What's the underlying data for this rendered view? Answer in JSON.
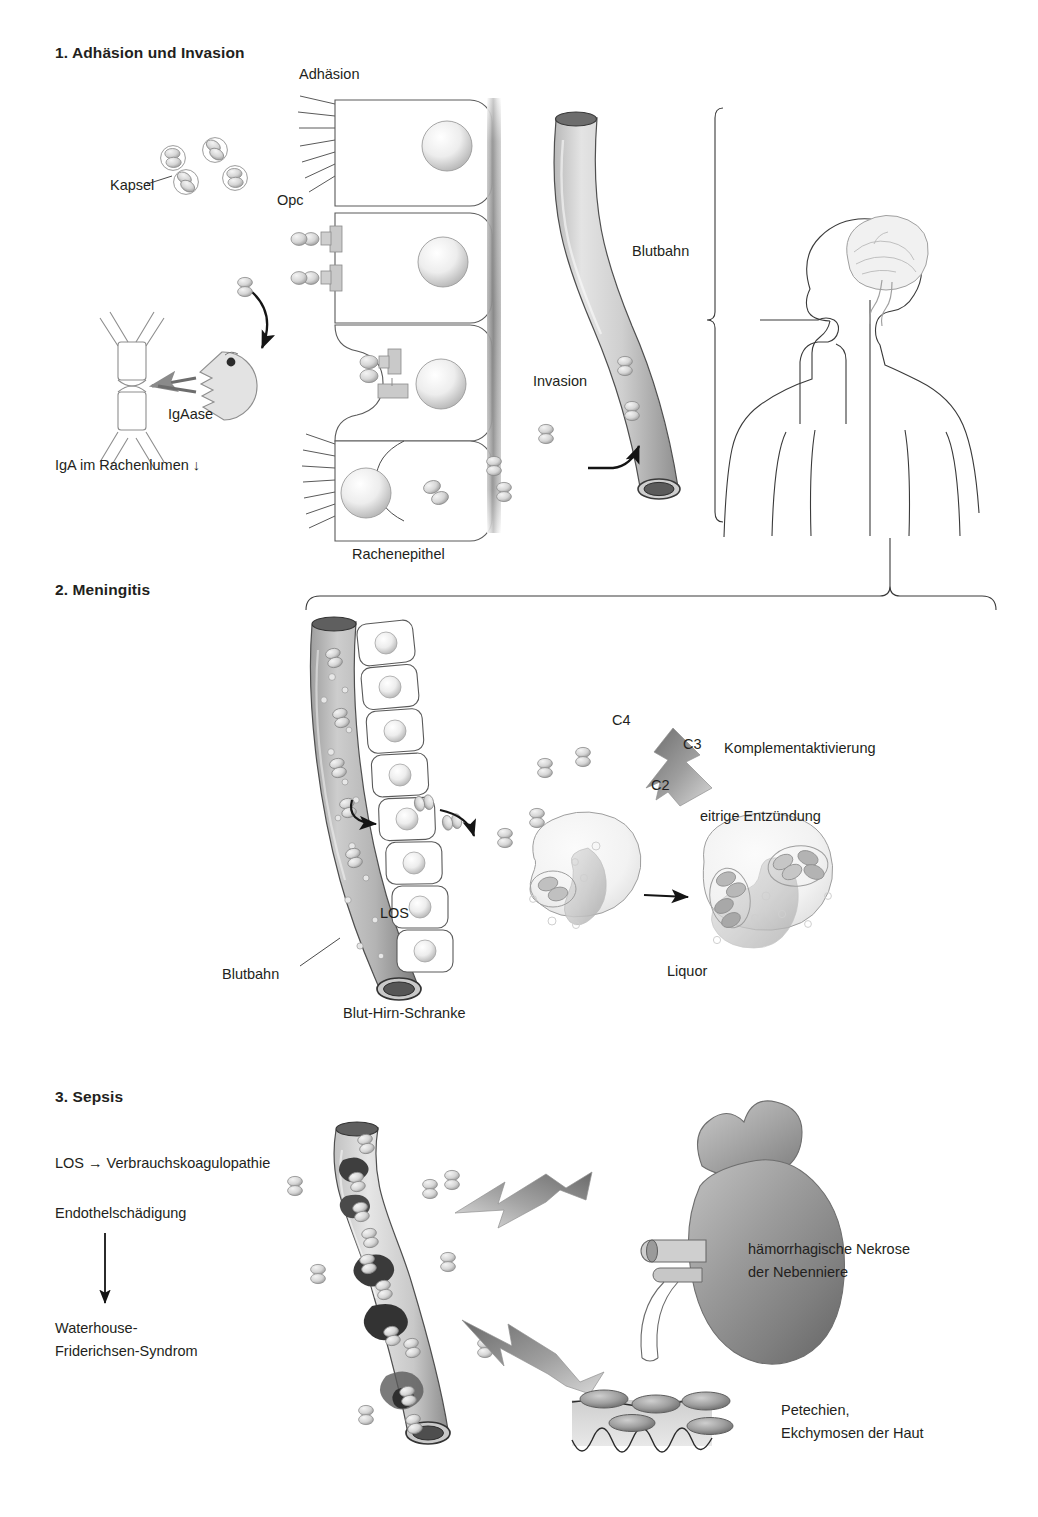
{
  "figure": {
    "language": "de"
  },
  "sections": [
    {
      "id": "adhaesion-invasion",
      "heading": "1. Adhäsion und Invasion",
      "labels": {
        "adhaesion": "Adhäsion",
        "kapsel": "Kapsel",
        "opc": "Opc",
        "igaase": "IgAase",
        "iga_lumen": "IgA im Rachenlumen ↓",
        "rachenepithel": "Rachenepithel",
        "blutbahn": "Blutbahn",
        "invasion": "Invasion"
      },
      "elements": [
        "diplokokken mit Kapsel",
        "IgA-Dimer Antikoerper",
        "IgAase Enzym",
        "Rachenepithelzellen mit Mikrovilli",
        "Opc-Adhaesine",
        "Basalmembran",
        "Blutgefaess",
        "Koerpersilhouette mit Gehirn"
      ]
    },
    {
      "id": "meningitis",
      "heading": "2. Meningitis",
      "labels": {
        "los": "LOS",
        "blutbahn": "Blutbahn",
        "blut_hirn_schranke": "Blut-Hirn-Schranke",
        "liquor": "Liquor",
        "komplement": "Komplementaktivierung",
        "c4": "C4",
        "c3": "C3",
        "c2": "C2",
        "eitrige_entzuendung": "eitrige Entzündung"
      },
      "elements": [
        "Blutgefaess mit LOS",
        "Endothelzellen der Blut-Hirn-Schranke",
        "Granulozyt mit phagozytierten Bakterien",
        "Granulozyt eitrige Entzuendung",
        "Komplement-Zickzackpfeil"
      ]
    },
    {
      "id": "sepsis",
      "heading": "3. Sepsis",
      "labels": {
        "los_koagulopathie": "LOS → Verbrauchskoagulopathie",
        "endothelschaedigung": "Endothelschädigung",
        "waterhouse_line1": "Waterhouse-",
        "waterhouse_line2": "Friderichsen-Syndrom",
        "nekrose_line1": "hämorrhagische Nekrose",
        "nekrose_line2": "der Nebenniere",
        "petechien_line1": "Petechien,",
        "petechien_line2": "Ekchymosen der Haut"
      },
      "elements": [
        "Blutgefaess mit Thromben",
        "Niere mit Nebenniere",
        "Haut mit Petechien",
        "Zickzackpfeil zur Nebenniere",
        "Zickzackpfeil zur Haut"
      ]
    }
  ],
  "colors": {
    "ink": "#231f20",
    "line": "#3a3a3a",
    "vessel_light": "#d9d9d9",
    "vessel_mid": "#9a9a9a",
    "vessel_dark": "#555555",
    "organ_mid": "#8e8e8e",
    "arrow_grey": "#7d7d7d",
    "background": "#ffffff"
  }
}
